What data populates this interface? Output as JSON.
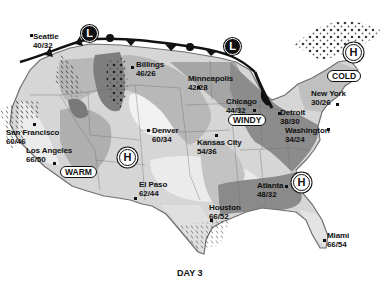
{
  "caption": "DAY 3",
  "colors": {
    "land_light": "#e6e6e6",
    "band_mid": "#b5b5b5",
    "band_dark": "#8a8a8a",
    "band_pale": "#f2f2f2",
    "front_line": "#111111",
    "outline": "#6f6f6f"
  },
  "cities": [
    {
      "name": "Seattle",
      "temp": "40/32"
    },
    {
      "name": "Billings",
      "temp": "46/26"
    },
    {
      "name": "Minneapolis",
      "temp": "42/28"
    },
    {
      "name": "Chicago",
      "temp": "44/32"
    },
    {
      "name": "New York",
      "temp": "30/26"
    },
    {
      "name": "Detroit",
      "temp": "38/30"
    },
    {
      "name": "Washington",
      "temp": "34/24"
    },
    {
      "name": "San Francisco",
      "temp": "60/46"
    },
    {
      "name": "Los Angeles",
      "temp": "66/50"
    },
    {
      "name": "Denver",
      "temp": "60/34"
    },
    {
      "name": "Kansas City",
      "temp": "54/36"
    },
    {
      "name": "El Paso",
      "temp": "62/44"
    },
    {
      "name": "Atlanta",
      "temp": "48/32"
    },
    {
      "name": "Houston",
      "temp": "66/52"
    },
    {
      "name": "Miami",
      "temp": "66/54"
    }
  ],
  "tags": {
    "cold": "COLD",
    "windy": "WINDY",
    "warm": "WARM"
  },
  "pressure": [
    {
      "type": "low",
      "label": "L"
    },
    {
      "type": "low",
      "label": "L"
    },
    {
      "type": "high",
      "label": "H"
    },
    {
      "type": "high",
      "label": "H"
    },
    {
      "type": "high",
      "label": "H"
    }
  ]
}
